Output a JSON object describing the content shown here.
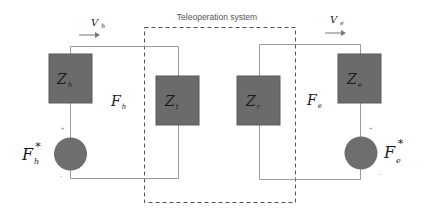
{
  "diagram": {
    "title": "Teleoperation system",
    "colors": {
      "box_fill": "#6b6b6b",
      "box_stroke": "#5a5a5a",
      "wire": "#9a9a9a",
      "dashed_border": "#555555",
      "source_fill": "#6e6e6e",
      "text": "#1a1a1a",
      "title_text": "#555555"
    },
    "left_side": {
      "velocity": {
        "main": "V",
        "sub": "h"
      },
      "impedance_human": {
        "main": "Z",
        "sub": "h"
      },
      "force": {
        "main": "F",
        "sub": "h"
      },
      "source": {
        "main": "F",
        "sub": "h",
        "sup": "*"
      },
      "plus_sign": "+",
      "minus_sign": "-"
    },
    "teleoperation": {
      "impedance_master": {
        "main": "Z",
        "sub": "t"
      },
      "impedance_slave": {
        "main": "Z",
        "sub": "r"
      }
    },
    "right_side": {
      "velocity": {
        "main": "V",
        "sub": "e"
      },
      "impedance_env": {
        "main": "Z",
        "sub": "e"
      },
      "force": {
        "main": "F",
        "sub": "e"
      },
      "source": {
        "main": "F",
        "sub": "e",
        "sup": "*"
      },
      "plus_sign": "+",
      "minus_sign": "-"
    }
  }
}
